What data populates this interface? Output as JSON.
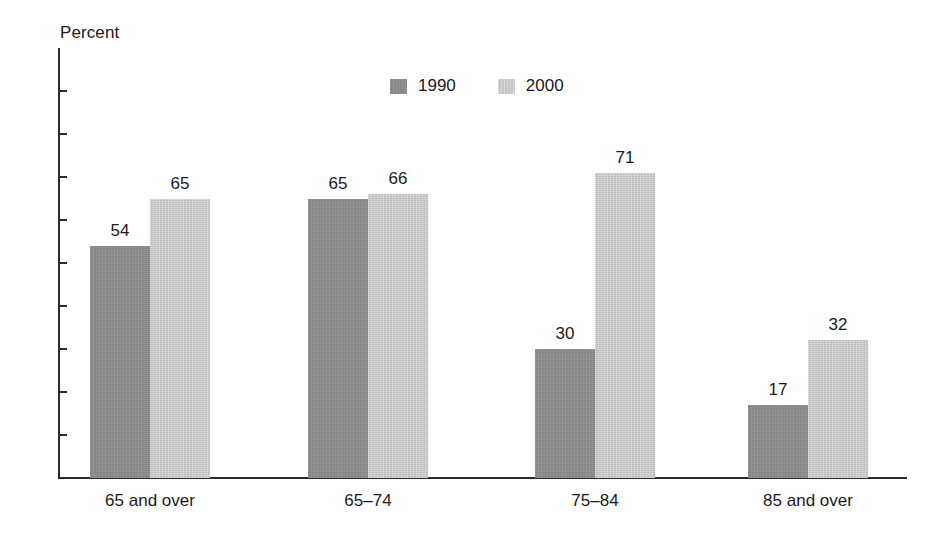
{
  "chart_data": {
    "type": "bar",
    "title": "",
    "subtitle": "",
    "xlabel": "",
    "ylabel": "Percent",
    "ylim": [
      0,
      100
    ],
    "yticks": [
      0,
      10,
      20,
      30,
      40,
      50,
      60,
      70,
      80,
      90,
      100
    ],
    "grid": false,
    "legend_position": "top-center",
    "categories": [
      "65 and over",
      "65–74",
      "75–84",
      "85 and over"
    ],
    "series": [
      {
        "name": "1990",
        "color": "#8d8d8d",
        "values": [
          54,
          65,
          30,
          17
        ]
      },
      {
        "name": "2000",
        "color": "#cacaca",
        "values": [
          65,
          66,
          71,
          32
        ]
      }
    ],
    "value_labels": {
      "65 and over": {
        "1990": "54",
        "2000": "65"
      },
      "65–74": {
        "1990": "70",
        "2000": "66"
      },
      "75–84": {
        "1990": "30",
        "2000": "71"
      },
      "85 and over": {
        "1990": "17",
        "2000": "32"
      }
    },
    "series_values_displayed": {
      "1990": [
        "54",
        "70",
        "30",
        "17"
      ],
      "2000": [
        "65",
        "66",
        "71",
        "32"
      ]
    }
  },
  "axis": {
    "y_title": "Percent",
    "y_tick_labels": [
      "100",
      "90",
      "80",
      "70",
      "60",
      "50",
      "40",
      "30",
      "20",
      "10",
      "0"
    ],
    "x_tick_labels": [
      "65 and over",
      "65–74",
      "75–84",
      "85 and over"
    ]
  },
  "legend": {
    "items": [
      {
        "label": "1990",
        "swatch": "dark-gray-swatch"
      },
      {
        "label": "2000",
        "swatch": "light-gray-swatch"
      }
    ]
  },
  "bars": [
    {
      "group": "65 and over",
      "series": "1990",
      "value": 54,
      "label": "54"
    },
    {
      "group": "65 and over",
      "series": "2000",
      "value": 65,
      "label": "65"
    },
    {
      "group": "65–74",
      "series": "1990",
      "value": 70,
      "label": "70"
    },
    {
      "group": "65–74",
      "series": "2000",
      "value": 66,
      "label": "66"
    },
    {
      "group": "75–84",
      "series": "1990",
      "value": 30,
      "label": "30"
    },
    {
      "group": "75–84",
      "series": "2000",
      "value": 71,
      "label": "71"
    },
    {
      "group": "85 and over",
      "series": "1990",
      "value": 17,
      "label": "17"
    },
    {
      "group": "85 and over",
      "series": "2000",
      "value": 32,
      "label": "32"
    }
  ],
  "colors": {
    "series_1990": "#8d8d8d",
    "series_2000": "#cacaca",
    "axis": "#2b2b2b",
    "text": "#1a1a1a",
    "background": "#ffffff"
  }
}
